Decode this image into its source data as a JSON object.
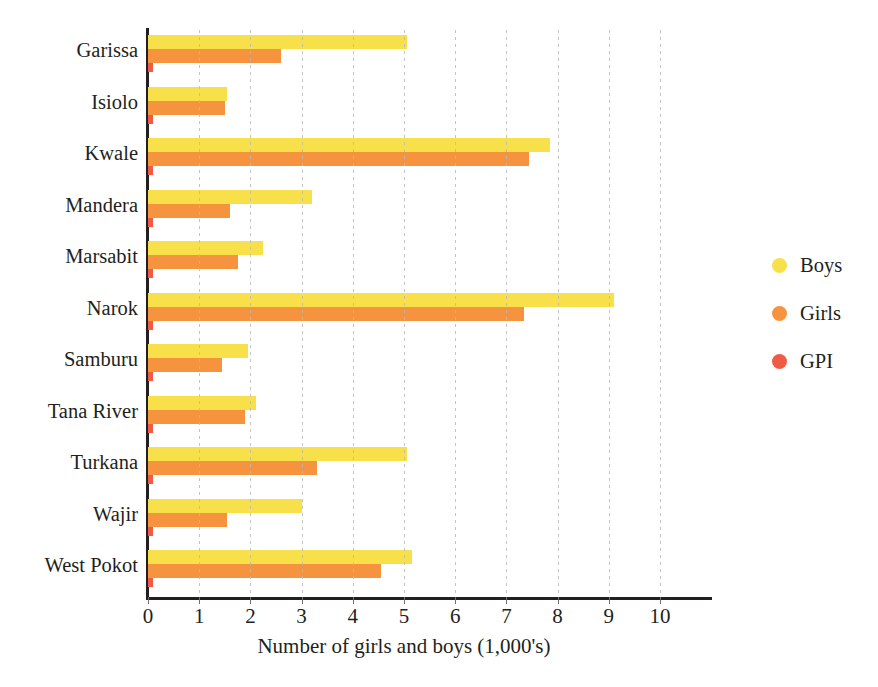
{
  "chart_data": {
    "type": "bar",
    "orientation": "horizontal",
    "title": "",
    "xlabel": "Number of girls and boys (1,000's)",
    "ylabel": "",
    "xlim": [
      0,
      10
    ],
    "xticks": [
      0,
      1,
      2,
      3,
      4,
      5,
      6,
      7,
      8,
      9,
      10
    ],
    "grid": true,
    "grid_axis": "x",
    "legend_position": "right",
    "categories": [
      "Garissa",
      "Isiolo",
      "Kwale",
      "Mandera",
      "Marsabit",
      "Narok",
      "Samburu",
      "Tana River",
      "Turkana",
      "Wajir",
      "West Pokot"
    ],
    "series": [
      {
        "name": "Boys",
        "color": "#F7E04A",
        "values": [
          5.05,
          1.55,
          7.85,
          3.2,
          2.25,
          9.1,
          1.95,
          2.1,
          5.05,
          3.0,
          5.15
        ]
      },
      {
        "name": "Girls",
        "color": "#F5933F",
        "values": [
          2.6,
          1.5,
          7.45,
          1.6,
          1.75,
          7.35,
          1.45,
          1.9,
          3.3,
          1.55,
          4.55
        ]
      },
      {
        "name": "GPI",
        "color": "#EF5B45",
        "values": [
          0.1,
          0.1,
          0.1,
          0.1,
          0.1,
          0.1,
          0.1,
          0.1,
          0.1,
          0.1,
          0.1
        ]
      }
    ]
  },
  "axis": {
    "line_color": "#231f20",
    "grid_color": "#b9b9b9"
  }
}
